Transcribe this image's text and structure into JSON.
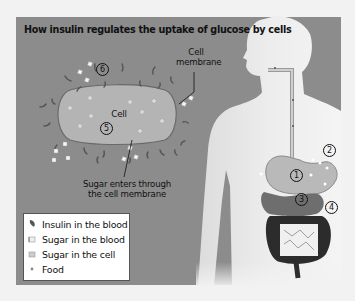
{
  "title": "How insulin regulates the uptake of glucose by cells",
  "labels": {
    "cell_membrane": [
      "Cell",
      "membrane"
    ],
    "cell": "Cell",
    "sugar_enters": [
      "Sugar enters through",
      "the cell membrane"
    ]
  },
  "steps": [
    "1",
    "2",
    "3",
    "4",
    "5",
    "6"
  ],
  "legend": [
    {
      "icon": "insulin-icon",
      "label": "Insulin in the blood"
    },
    {
      "icon": "sugar-blood-icon",
      "label": "Sugar in the blood"
    },
    {
      "icon": "sugar-cell-icon",
      "label": "Sugar in the cell"
    },
    {
      "icon": "food-icon",
      "label": "Food"
    }
  ],
  "colors": {
    "background": "#8c8c8c",
    "cell_fill": "#b4b4b4",
    "body": "#e6e6e6",
    "organ_dark": "#3a3a3a"
  }
}
